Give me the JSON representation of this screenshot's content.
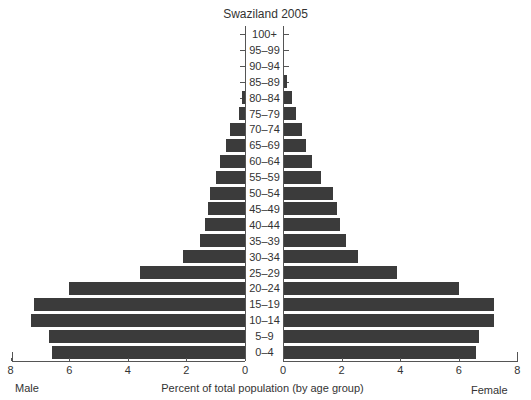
{
  "chart_data": {
    "type": "bar",
    "orientation": "horizontal",
    "subtype": "population-pyramid",
    "title": "Swaziland 2005",
    "xlabel": "Percent of total population (by age group)",
    "ylabel": "",
    "left_label": "Male",
    "right_label": "Female",
    "categories": [
      "100+",
      "95–99",
      "90–94",
      "85–89",
      "80–84",
      "75–79",
      "70–74",
      "65–69",
      "60–64",
      "55–59",
      "50–54",
      "45–49",
      "40–44",
      "35–39",
      "30–34",
      "25–29",
      "20–24",
      "15–19",
      "10–14",
      "5–9",
      "0–4"
    ],
    "series": [
      {
        "name": "Male",
        "values": [
          0,
          0,
          0,
          0,
          0.1,
          0.2,
          0.5,
          0.65,
          0.85,
          1.0,
          1.2,
          1.25,
          1.35,
          1.55,
          2.1,
          3.6,
          6.0,
          7.2,
          7.3,
          6.7,
          6.6
        ]
      },
      {
        "name": "Female",
        "values": [
          0,
          0,
          0,
          0.15,
          0.3,
          0.45,
          0.65,
          0.8,
          1.0,
          1.3,
          1.7,
          1.85,
          1.95,
          2.15,
          2.55,
          3.9,
          6.0,
          7.2,
          7.2,
          6.7,
          6.6
        ]
      }
    ],
    "xlim": [
      0,
      8
    ],
    "x_ticks_male": [
      "8",
      "6",
      "4",
      "2",
      "0"
    ],
    "x_ticks_female": [
      "0",
      "2",
      "4",
      "6",
      "8"
    ],
    "grid": false,
    "legend": "none",
    "bar_color": "#3b3b3b"
  }
}
